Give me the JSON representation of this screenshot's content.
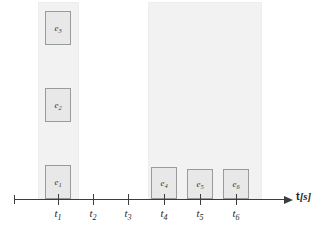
{
  "figure": {
    "type": "event-timeline",
    "axis": {
      "label_prefix": "t",
      "label_unit": "[s]",
      "label_full": "t[s]",
      "line_color": "#3c3c3c",
      "start_x": 14,
      "end_x": 286,
      "baseline_y": 199
    },
    "ticks": [
      {
        "id": "t1",
        "base": "t",
        "sub": "1",
        "x": 58
      },
      {
        "id": "t2",
        "base": "t",
        "sub": "2",
        "x": 93
      },
      {
        "id": "t3",
        "base": "t",
        "sub": "3",
        "x": 128
      },
      {
        "id": "t4",
        "base": "t",
        "sub": "4",
        "x": 164
      },
      {
        "id": "t5",
        "base": "t",
        "sub": "5",
        "x": 200
      },
      {
        "id": "t6",
        "base": "t",
        "sub": "6",
        "x": 236
      }
    ],
    "bands": [
      {
        "id": "band-left",
        "x": 38,
        "y": 2,
        "width": 41,
        "height": 197,
        "color": "#f2f2f2"
      },
      {
        "id": "band-right",
        "x": 148,
        "y": 2,
        "width": 114,
        "height": 197,
        "color": "#f2f2f2"
      }
    ],
    "events": [
      {
        "id": "e1",
        "base": "e",
        "sub": "1",
        "tick": "t1",
        "x": 45,
        "y": 165,
        "width": 26,
        "height": 34
      },
      {
        "id": "e2",
        "base": "e",
        "sub": "2",
        "tick": "t1",
        "x": 45,
        "y": 88,
        "width": 26,
        "height": 34
      },
      {
        "id": "e3",
        "base": "e",
        "sub": "3",
        "tick": "t1",
        "x": 45,
        "y": 11,
        "width": 26,
        "height": 34
      },
      {
        "id": "e4",
        "base": "e",
        "sub": "4",
        "tick": "t4",
        "x": 151,
        "y": 167,
        "width": 26,
        "height": 32
      },
      {
        "id": "e5",
        "base": "e",
        "sub": "5",
        "tick": "t5",
        "x": 187,
        "y": 169,
        "width": 26,
        "height": 30
      },
      {
        "id": "e6",
        "base": "e",
        "sub": "6",
        "tick": "t6",
        "x": 223,
        "y": 169,
        "width": 26,
        "height": 30
      }
    ],
    "colors": {
      "event_fill": "#e8e8e8",
      "event_stroke": "#9a9a9a",
      "band_fill": "#f2f2f2",
      "axis": "#3c3c3c",
      "text": "#1e1e1e"
    }
  }
}
